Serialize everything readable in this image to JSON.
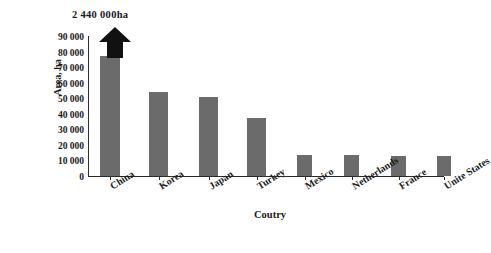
{
  "chart_data": {
    "type": "bar",
    "title": "",
    "xlabel": "Coutry",
    "ylabel": "Area, ha",
    "categories": [
      "China",
      "Korea",
      "Japan",
      "Turkey",
      "Mexico",
      "Netherlands",
      "France",
      "Unite States"
    ],
    "values": [
      2440000,
      54000,
      51000,
      37000,
      13500,
      13500,
      13000,
      13000
    ],
    "ylim": [
      0,
      90000
    ],
    "ytick_labels": [
      "90 000",
      "80 000",
      "70 000",
      "60 000",
      "50 000",
      "40 000",
      "30 000",
      "20 000",
      "10 000",
      "0"
    ],
    "ytick_values": [
      90000,
      80000,
      70000,
      60000,
      50000,
      40000,
      30000,
      20000,
      10000,
      0
    ],
    "grid": false,
    "legend": "none",
    "broken_axis": true,
    "annotations": [
      {
        "label": "2 440 000ha",
        "category": "China",
        "value": 2440000,
        "note": "value exceeds axis; bar drawn clipped with upward arrow"
      }
    ],
    "bar_color": "#6b6b6b",
    "arrow_color": "#111111",
    "axis_color": "#2b2b2b",
    "background": "#ffffff"
  },
  "axes": {
    "y_title": "Area, ha",
    "x_title": "Coutry"
  }
}
